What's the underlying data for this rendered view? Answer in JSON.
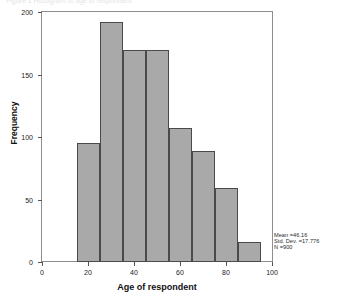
{
  "top_caption": "Figure 1  Histogram of age of respondent",
  "chart_data": {
    "type": "bar",
    "title": "",
    "subtitle": "",
    "xlabel": "Age of respondent",
    "ylabel": "Frequency",
    "xlim": [
      0,
      100
    ],
    "ylim": [
      0,
      200
    ],
    "grid": false,
    "legend": "none",
    "bin_width": 10,
    "bin_edges": [
      15,
      25,
      35,
      45,
      55,
      65,
      75,
      85,
      95
    ],
    "categories": [
      "15-25",
      "25-35",
      "35-45",
      "45-55",
      "55-65",
      "65-75",
      "75-85",
      "85-95"
    ],
    "values": [
      95,
      192,
      170,
      170,
      107,
      89,
      59,
      16
    ],
    "x_ticks": [
      0,
      20,
      40,
      60,
      80,
      100
    ],
    "x_tick_labels": [
      "0",
      "20",
      "40",
      "60",
      "80",
      "100"
    ],
    "y_ticks": [
      0,
      50,
      100,
      150,
      200
    ],
    "y_tick_labels": [
      "0",
      "50",
      "100",
      "150",
      "200"
    ],
    "bar_fill_color": "#a9a9a9",
    "bar_edge_color": "#4a4a4a",
    "annotations": {
      "mean_label": "Mean =46.16",
      "std_dev_label": "Std. Dev. =17.776",
      "n_label": "N =900"
    }
  }
}
